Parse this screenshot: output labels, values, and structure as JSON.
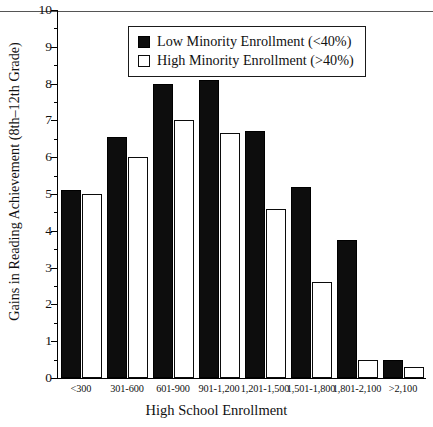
{
  "chart_data": {
    "type": "bar",
    "title": "",
    "xlabel": "High School Enrollment",
    "ylabel": "Gains in Reading Achievement (8th–12th Grade)",
    "categories": [
      "<300",
      "301-600",
      "601-900",
      "901-1,200",
      "1,201-1,500",
      "1,501-1,800",
      "1,801-2,100",
      ">2,100"
    ],
    "series": [
      {
        "name": "Low Minority Enrollment (<40%)",
        "color": "#0d0d0d",
        "values": [
          5.1,
          6.55,
          8.0,
          8.1,
          6.7,
          5.2,
          3.75,
          0.5
        ]
      },
      {
        "name": "High Minority Enrollment (>40%)",
        "color": "#ffffff",
        "values": [
          5.0,
          6.0,
          7.0,
          6.65,
          4.6,
          2.6,
          0.5,
          0.3
        ]
      }
    ],
    "ylim": [
      0,
      10
    ],
    "ytick_labels": [
      "0",
      "1",
      "2",
      "3",
      "4",
      "5",
      "6",
      "7",
      "8",
      "9",
      "10"
    ],
    "ytick_values": [
      0,
      1,
      2,
      3,
      4,
      5,
      6,
      7,
      8,
      9,
      10
    ],
    "yminor_step": 0.5,
    "grid": false,
    "legend_position": "top-center"
  },
  "legend": {
    "entries": [
      {
        "label": "Low Minority Enrollment (<40%)",
        "swatch": "filled-black"
      },
      {
        "label": "High Minority Enrollment (>40%)",
        "swatch": "outlined-white"
      }
    ]
  }
}
